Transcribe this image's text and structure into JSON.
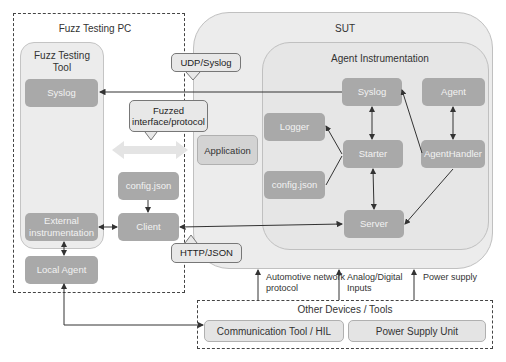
{
  "fuzz_pc": {
    "title": "Fuzz Testing PC",
    "tool_title": "Fuzz Testing Tool",
    "nodes": {
      "syslog": "Syslog",
      "external_instrumentation": "External instrumentation",
      "local_agent": "Local Agent",
      "config_json": "config.json",
      "client": "Client"
    }
  },
  "callouts": {
    "udp_syslog": "UDP/Syslog",
    "fuzzed_interface": "Fuzzed interface/protocol",
    "http_json": "HTTP/JSON"
  },
  "sut": {
    "title": "SUT",
    "application": "Application",
    "agent_instrumentation": {
      "title": "Agent Instrumentation",
      "nodes": {
        "syslog": "Syslog",
        "agent": "Agent",
        "logger": "Logger",
        "starter": "Starter",
        "agent_handler": "AgentHandler",
        "config_json": "config.json",
        "server": "Server"
      }
    }
  },
  "links": {
    "automotive": "Automotive network protocol",
    "analog_digital": "Analog/Digital Inputs",
    "power_supply": "Power supply"
  },
  "other_devices": {
    "title": "Other Devices / Tools",
    "comm_tool": "Communication Tool / HIL",
    "psu": "Power Supply Unit"
  },
  "colors": {
    "node_fill": "#a9a9a9",
    "panel_fill": "#ececec",
    "arrow": "#333333",
    "fuzz_arrow": "#e4e4e4"
  }
}
